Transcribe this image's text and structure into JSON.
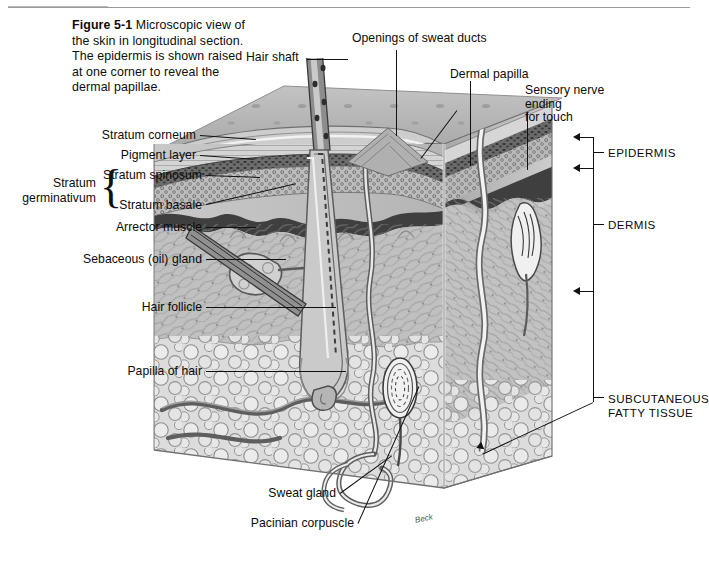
{
  "figure": {
    "number": "Figure 5-1",
    "caption": "Microscopic view of the skin in longitudinal section. The epidermis is shown raised at one corner to reveal the dermal papillae.",
    "artist_signature": "Beck"
  },
  "labels_left": [
    {
      "id": "stratum-corneum",
      "text": "Stratum corneum"
    },
    {
      "id": "pigment-layer",
      "text": "Pigment layer"
    },
    {
      "id": "stratum-spinosum",
      "text": "Stratum spinosum"
    },
    {
      "id": "stratum-basale",
      "text": "Stratum basale"
    },
    {
      "id": "arrector-muscle",
      "text": "Arrector muscle"
    },
    {
      "id": "sebaceous-gland",
      "text": "Sebaceous (oil) gland"
    },
    {
      "id": "hair-follicle",
      "text": "Hair follicle"
    },
    {
      "id": "papilla-of-hair",
      "text": "Papilla of hair"
    }
  ],
  "brace_group": {
    "line1": "Stratum",
    "line2": "germinativum"
  },
  "labels_top": [
    {
      "id": "hair-shaft",
      "text": "Hair shaft"
    },
    {
      "id": "openings-sweat-ducts",
      "text": "Openings of sweat ducts"
    },
    {
      "id": "dermal-papilla",
      "text": "Dermal papilla"
    }
  ],
  "label_sensory": {
    "line1": "Sensory nerve ending",
    "line2": "for touch"
  },
  "labels_bottom": [
    {
      "id": "sweat-gland",
      "text": "Sweat gland"
    },
    {
      "id": "pacinian-corpuscle",
      "text": "Pacinian corpuscle"
    }
  ],
  "layer_brackets": [
    {
      "id": "epidermis",
      "text": "EPIDERMIS"
    },
    {
      "id": "dermis",
      "text": "DERMIS"
    },
    {
      "id": "subcutaneous",
      "line1": "SUBCUTANEOUS",
      "line2": "FATTY TISSUE"
    }
  ],
  "colors": {
    "ink": "#111111",
    "surface_gray": "#b6b6b6",
    "surface_gray_dark": "#9d9d9d",
    "epidermis_gray": "#8e8e8e",
    "dermis_gray": "#c2c2c2",
    "fat_gray": "#d8d8d8",
    "dark_structure": "#595959",
    "highlight": "#efefef",
    "rule": "#9a9a9a",
    "page_bg": "#ffffff"
  }
}
